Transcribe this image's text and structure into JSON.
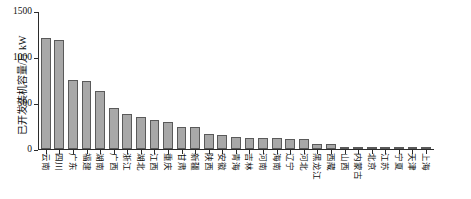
{
  "chart_data": {
    "type": "bar",
    "title": "",
    "xlabel": "",
    "ylabel": "已开发装机容量/万 kW",
    "ylim": [
      0,
      1500
    ],
    "yticks": [
      0,
      500,
      1000,
      1500
    ],
    "ytick_labels": [
      "0",
      "500",
      "1000",
      "1500"
    ],
    "grid": false,
    "legend": "none",
    "bar_color": "#a8a8a8",
    "bar_edge_color": "#5a5a5a",
    "axis_color": "#2b2b2b",
    "categories": [
      "云南",
      "四川",
      "广东",
      "福建",
      "湖南",
      "广西",
      "浙江",
      "湖北",
      "江西",
      "重庆",
      "甘肃",
      "新疆",
      "陕西",
      "安徽",
      "青海",
      "吉林",
      "河南",
      "海南",
      "辽宁",
      "河北",
      "黑龙江",
      "西藏",
      "山西",
      "内蒙古",
      "北京",
      "江苏",
      "宁夏",
      "天津",
      "上海"
    ],
    "values": [
      1215,
      1195,
      755,
      740,
      630,
      450,
      380,
      350,
      320,
      300,
      245,
      240,
      160,
      150,
      130,
      125,
      120,
      118,
      115,
      110,
      60,
      52,
      18,
      14,
      10,
      8,
      6,
      3,
      2
    ]
  },
  "axis": {
    "y_title": "已开发装机容量/万 kW"
  }
}
